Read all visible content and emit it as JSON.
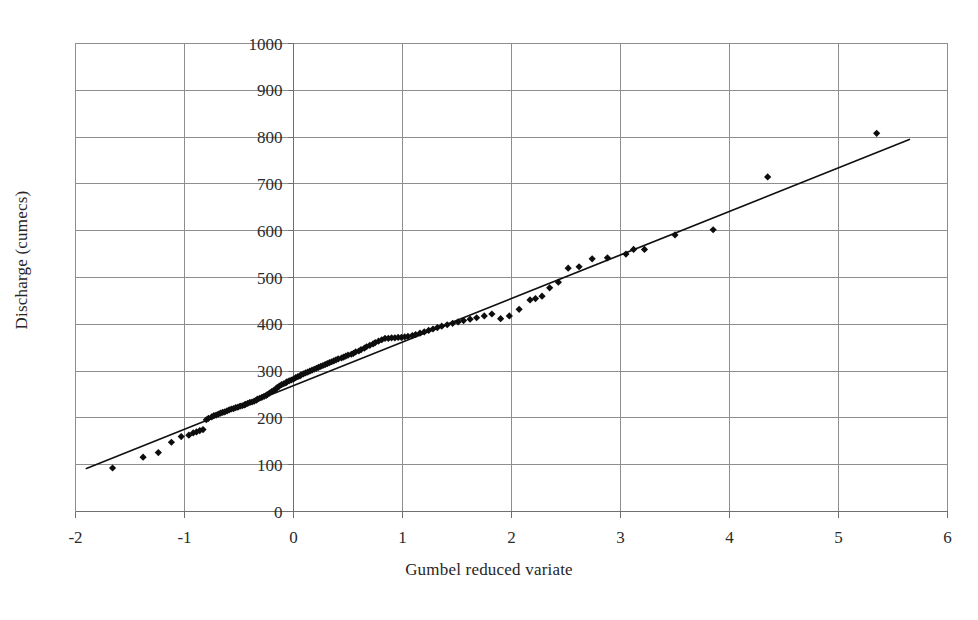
{
  "chart_data": {
    "type": "scatter",
    "title": "",
    "xlabel": "Gumbel reduced variate",
    "ylabel": "Discharge (cumecs)",
    "xlim": [
      -2,
      6
    ],
    "ylim": [
      0,
      1000
    ],
    "xticks": [
      -2,
      -1,
      0,
      1,
      2,
      3,
      4,
      5,
      6
    ],
    "yticks": [
      0,
      100,
      200,
      300,
      400,
      500,
      600,
      700,
      800,
      900,
      1000
    ],
    "xtick_labels": [
      "-2",
      "-1",
      "0",
      "1",
      "2",
      "3",
      "4",
      "5",
      "6"
    ],
    "ytick_labels": [
      "0",
      "100",
      "200",
      "300",
      "400",
      "500",
      "600",
      "700",
      "800",
      "900",
      "1000"
    ],
    "grid": true,
    "legend": false,
    "legend_position": "none",
    "marker": "diamond",
    "marker_color": "#0d0d0d",
    "series": [
      {
        "name": "Annual maximum discharge",
        "type": "scatter",
        "x": [
          -1.66,
          -1.38,
          -1.24,
          -1.12,
          -1.03,
          -0.96,
          -0.92,
          -0.89,
          -0.86,
          -0.83,
          -0.8,
          -0.78,
          -0.75,
          -0.73,
          -0.71,
          -0.69,
          -0.67,
          -0.65,
          -0.63,
          -0.61,
          -0.59,
          -0.57,
          -0.55,
          -0.53,
          -0.51,
          -0.49,
          -0.47,
          -0.45,
          -0.44,
          -0.42,
          -0.4,
          -0.38,
          -0.36,
          -0.34,
          -0.33,
          -0.31,
          -0.29,
          -0.27,
          -0.25,
          -0.24,
          -0.22,
          -0.2,
          -0.18,
          -0.16,
          -0.15,
          -0.13,
          -0.11,
          -0.09,
          -0.07,
          -0.06,
          -0.04,
          -0.02,
          0.0,
          0.02,
          0.04,
          0.06,
          0.07,
          0.09,
          0.11,
          0.13,
          0.15,
          0.17,
          0.19,
          0.21,
          0.23,
          0.25,
          0.27,
          0.29,
          0.31,
          0.33,
          0.35,
          0.37,
          0.39,
          0.41,
          0.44,
          0.46,
          0.48,
          0.5,
          0.53,
          0.55,
          0.57,
          0.6,
          0.62,
          0.65,
          0.67,
          0.7,
          0.73,
          0.75,
          0.78,
          0.81,
          0.84,
          0.87,
          0.9,
          0.93,
          0.96,
          0.99,
          1.02,
          1.05,
          1.09,
          1.12,
          1.16,
          1.2,
          1.24,
          1.28,
          1.32,
          1.36,
          1.41,
          1.46,
          1.51,
          1.56,
          1.62,
          1.68,
          1.75,
          1.82,
          1.9,
          1.98,
          2.07,
          2.17,
          2.22,
          2.28,
          2.35,
          2.43,
          2.52,
          2.62,
          2.74,
          2.88,
          3.05,
          3.12,
          3.22,
          3.5,
          3.85,
          4.35,
          5.35
        ],
        "y": [
          93,
          116,
          126,
          148,
          160,
          163,
          168,
          170,
          173,
          175,
          196,
          199,
          202,
          205,
          206,
          208,
          210,
          212,
          213,
          215,
          217,
          219,
          220,
          222,
          223,
          225,
          226,
          228,
          229,
          231,
          233,
          234,
          236,
          238,
          240,
          242,
          244,
          246,
          248,
          250,
          253,
          256,
          259,
          262,
          265,
          268,
          271,
          273,
          275,
          277,
          279,
          281,
          283,
          286,
          288,
          290,
          292,
          294,
          296,
          298,
          300,
          302,
          304,
          306,
          308,
          310,
          312,
          314,
          316,
          318,
          320,
          322,
          324,
          326,
          328,
          330,
          332,
          334,
          336,
          338,
          341,
          343,
          346,
          349,
          352,
          355,
          358,
          361,
          364,
          367,
          370,
          370,
          371,
          371,
          372,
          372,
          373,
          374,
          376,
          378,
          381,
          384,
          387,
          390,
          393,
          396,
          399,
          402,
          405,
          408,
          411,
          414,
          418,
          422,
          412,
          418,
          432,
          452,
          455,
          460,
          478,
          490,
          520,
          523,
          540,
          542,
          550,
          560,
          560,
          591,
          602,
          715,
          808
        ]
      }
    ],
    "fit_line": {
      "name": "Gumbel fit",
      "type": "line",
      "x": [
        -1.9,
        5.65
      ],
      "y": [
        92,
        795
      ],
      "color": "#111111"
    }
  }
}
